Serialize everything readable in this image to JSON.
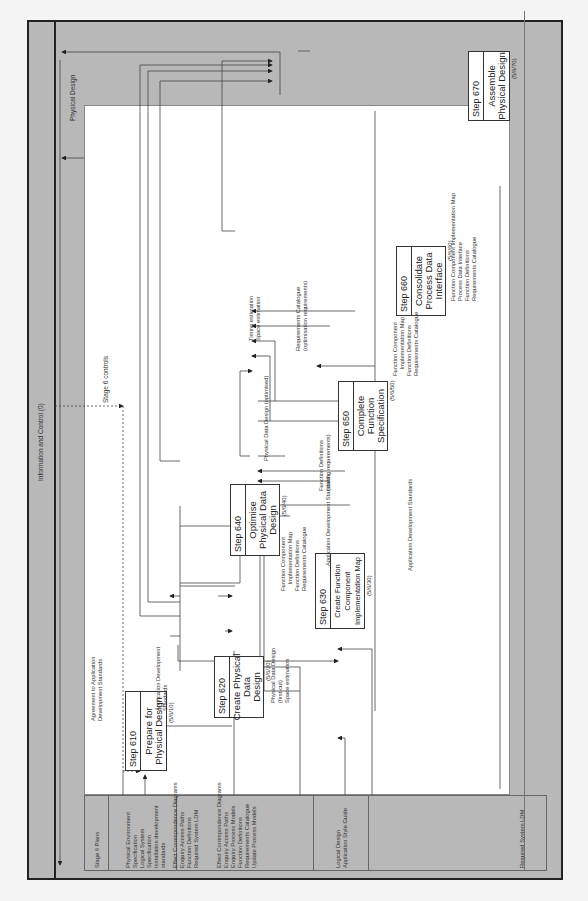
{
  "frame": {
    "title": "Information and Control (0)",
    "controls_label": "Stage 6 controls",
    "output_label": "Physical Design"
  },
  "inputs_band": {
    "groups": [
      {
        "lines": [
          "Stage 6 Plans"
        ]
      },
      {
        "lines": [
          "Physical Environment",
          "Specification",
          "Logical System",
          "Specification",
          "Installation development",
          "standards"
        ]
      },
      {
        "lines": [
          "Effect Correspondence Diagrams",
          "Enquiry Access Paths",
          "Function Definitions",
          "Required System LDM"
        ]
      },
      {
        "lines": [
          "Effect Correspondence Diagrams",
          "Enquiry Access Paths",
          "Enquiry Process Models",
          "Function Definitions",
          "Requirements Catalogue",
          "Update Process Models"
        ]
      },
      {
        "lines": [
          "Logical Design",
          "Application Style Guide"
        ]
      },
      {
        "lines": [
          "Required System LDM"
        ]
      }
    ]
  },
  "steps": [
    {
      "id": "610",
      "num": "Step  610",
      "title": "Prepare for\nPhysical Design",
      "ref": "(5/6/10)"
    },
    {
      "id": "620",
      "num": "Step  620",
      "title": "Create Physical\nData\nDesign",
      "ref": "(5/6/20)"
    },
    {
      "id": "630",
      "num": "Step  630",
      "title": "Create Function\nComponent\nImplementation Map",
      "ref": "(5/6/30)"
    },
    {
      "id": "640",
      "num": "Step  640",
      "title": "Optimise\nPhysical Data\nDesign",
      "ref": "(5/6/40)"
    },
    {
      "id": "650",
      "num": "Step  650",
      "title": "Complete\nFunction\nSpecification",
      "ref": "(5/6/50)"
    },
    {
      "id": "660",
      "num": "Step  660",
      "title": "Consolidate\nProcess Data\nInterface",
      "ref": "(5/6/60)"
    },
    {
      "id": "670",
      "num": "Step  670",
      "title": "Assemble\nPhysical Design",
      "ref": "(5/6/70)"
    }
  ],
  "flow_labels": {
    "agreement": "Agreement to Application\nDevelopment Standards",
    "app_dev_standards_1": "Application Development\nStandards",
    "s620_out": "Physical Data Design\n(first-cut)\nSpace estimation",
    "s640_in": "Function Component\n    Implementation Map\nFunction Definitions\nRequirements Catalogue",
    "app_dev_standards_2": "Application Development Standards",
    "app_dev_standards_3": "Application Development Standards",
    "pdd_optimised": "Physical Data Design (optimised)",
    "func_defs_sorting": "Function Definitions\n(sorting requirements)",
    "timing": "Timing estimation\nSpace estimation",
    "req_cat_opt": "Requirements Catalogue\n(optimisation requirements)",
    "s650_out": "Function Component\n    Implementation Map\nFunction Definitions\nRequirements Catalogue",
    "s660_out": "Function Component Implementation Map\nProcess Data Interface\nFunction Definitions\nRequirements Catalogue"
  }
}
